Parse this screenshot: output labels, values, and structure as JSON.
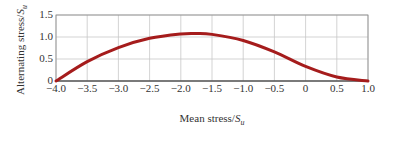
{
  "chart_data": {
    "type": "line",
    "title": "",
    "xlabel": "Mean stress/S_u",
    "ylabel": "Alternating stress/S_u",
    "xlim": [
      -4.0,
      1.0
    ],
    "ylim": [
      0,
      1.5
    ],
    "grid": true,
    "legend": null,
    "x_ticks": [
      "-4.0",
      "-3.5",
      "-3.0",
      "-2.5",
      "-2.0",
      "-1.5",
      "-1.0",
      "-0.5",
      "0",
      "0.5",
      "1.0"
    ],
    "y_ticks": [
      "0",
      "0.5",
      "1.0",
      "1.5"
    ],
    "series": [
      {
        "name": "Fatigue limit curve",
        "color": "#a51c1c",
        "x": [
          -4.0,
          -3.5,
          -3.0,
          -2.5,
          -2.0,
          -1.75,
          -1.5,
          -1.0,
          -0.5,
          0.0,
          0.5,
          1.0
        ],
        "y": [
          0.0,
          0.44,
          0.76,
          0.97,
          1.07,
          1.08,
          1.06,
          0.92,
          0.66,
          0.33,
          0.09,
          0.0
        ]
      }
    ]
  },
  "labels": {
    "xlabel_text": "Mean stress/",
    "xlabel_var": "S",
    "xlabel_sub": "u",
    "ylabel_text": "Alternating stress/",
    "ylabel_var": "S",
    "ylabel_sub": "u"
  }
}
